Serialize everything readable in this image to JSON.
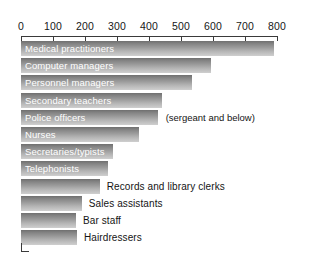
{
  "chart_data": {
    "type": "bar",
    "orientation": "horizontal",
    "title": "",
    "subtitle": "",
    "xlabel": "",
    "ylabel": "",
    "xlim": [
      0,
      800
    ],
    "grid": false,
    "legend": null,
    "axis": {
      "ticks": [
        0,
        100,
        200,
        300,
        400,
        500,
        600,
        700,
        800
      ],
      "tick_labels": [
        "0",
        "100",
        "200",
        "300",
        "400",
        "500",
        "600",
        "700",
        "800"
      ],
      "position": "top"
    },
    "categories": [
      "Medical practitioners",
      "Computer managers",
      "Personnel managers",
      "Secondary teachers",
      "Police officers",
      "Nurses",
      "Secretaries/typists",
      "Telephonists",
      "Records and library clerks",
      "Sales assistants",
      "Bar staff",
      "Hairdressers"
    ],
    "values": [
      790,
      595,
      533,
      442,
      427,
      368,
      287,
      271,
      246,
      190,
      172,
      175
    ],
    "annotations": [
      {
        "category": "Police officers",
        "text": "(sergeant and below)"
      }
    ],
    "label_placement": [
      "inside",
      "inside",
      "inside",
      "inside",
      "inside",
      "inside",
      "inside",
      "inside",
      "outside",
      "outside",
      "outside",
      "outside"
    ]
  },
  "style": {
    "bar_fill_top": "#6f6f6f",
    "bar_fill_bottom": "#cfcfcf",
    "axis_color": "#3a3a3a",
    "inside_label_color": "#ffffff",
    "outside_label_color": "#141414",
    "background": "#ffffff"
  }
}
